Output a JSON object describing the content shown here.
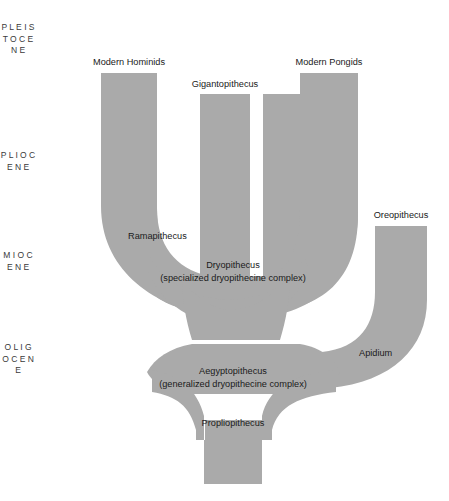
{
  "figure": {
    "type": "phylogenetic-tree",
    "background_color": "#ffffff",
    "branch_color": "#aaaaaa",
    "text_color": "#1a1a1a",
    "epoch_text_color": "#3a3a3a"
  },
  "epoch_axis": {
    "name": "geologic-epoch-scale",
    "orientation": "vertical",
    "epochs": [
      {
        "id": "pleistocene",
        "label": "PLEISTOCENE",
        "letters": "P L E I S T O C E N E",
        "top": 20,
        "height": 120
      },
      {
        "id": "pliocene",
        "label": "PLIOCENE",
        "letters": "P L I O C E N E",
        "top": 148,
        "height": 90
      },
      {
        "id": "miocene",
        "label": "MIOCENE",
        "letters": "M I O C E N E",
        "top": 248,
        "height": 80
      },
      {
        "id": "oligocene",
        "label": "OLIGOCENE",
        "letters": "O L I G O C E N E",
        "top": 340,
        "height": 100
      }
    ]
  },
  "taxa": [
    {
      "id": "modern-hominids",
      "label": "Modern Hominids",
      "x": 129,
      "y": 58,
      "align": "center"
    },
    {
      "id": "gigantopithecus",
      "label": "Gigantopithecus",
      "x": 225,
      "y": 80,
      "align": "center"
    },
    {
      "id": "modern-pongids",
      "label": "Modern Pongids",
      "x": 329,
      "y": 58,
      "align": "center"
    },
    {
      "id": "oreopithecus",
      "label": "Oreopithecus",
      "x": 401,
      "y": 210,
      "align": "center"
    },
    {
      "id": "ramapithecus",
      "label": "Ramapithecus",
      "x": 128,
      "y": 231,
      "align": "left"
    },
    {
      "id": "dryopithecus",
      "label": "Dryopithecus",
      "sublabel": "(specialized dryopithecine complex)",
      "x": 233,
      "y": 261,
      "align": "center"
    },
    {
      "id": "apidium",
      "label": "Apidium",
      "x": 359,
      "y": 348,
      "align": "left"
    },
    {
      "id": "aegyptopithecus",
      "label": "Aegyptopithecus",
      "sublabel": "(generalized dryopithecine complex)",
      "x": 233,
      "y": 366,
      "align": "center"
    },
    {
      "id": "propliopithecus",
      "label": "Propliopithecus",
      "x": 233,
      "y": 418,
      "align": "center"
    }
  ],
  "branches": [
    {
      "id": "branch-modern-hominids",
      "leads_to": "modern-hominids",
      "top_x_range": [
        101,
        157
      ]
    },
    {
      "id": "branch-gigantopithecus",
      "leads_to": "gigantopithecus",
      "top_x_range": [
        200,
        250
      ]
    },
    {
      "id": "branch-modern-pongids",
      "leads_to": "modern-pongids",
      "top_x_range": [
        300,
        358
      ]
    },
    {
      "id": "branch-oreopithecus",
      "leads_to": "oreopithecus",
      "top_x_range": [
        375,
        427
      ]
    },
    {
      "id": "trunk-propliopithecus",
      "leads_to": "propliopithecus",
      "bottom_x_range": [
        205,
        262
      ]
    }
  ]
}
